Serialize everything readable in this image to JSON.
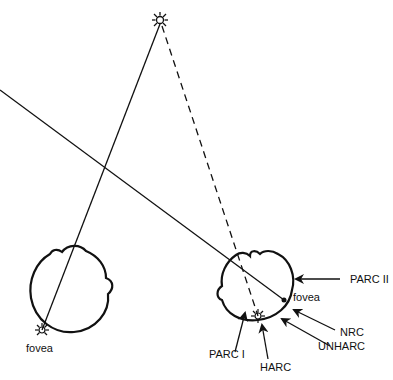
{
  "diagram": {
    "type": "binocular-fixation-schematic",
    "colors": {
      "ink": "#111111",
      "background": "#ffffff"
    },
    "target": {
      "icon": "sun-star-icon",
      "x": 160,
      "y": 20
    },
    "left_eye": {
      "center": [
        70,
        290
      ],
      "radius": 40,
      "fovea_label": "fovea",
      "fovea_point": [
        42,
        330
      ]
    },
    "right_eye": {
      "center": [
        256,
        290
      ],
      "radius": 38,
      "fovea_label": "fovea",
      "fovea_point": [
        284,
        300
      ],
      "harc_point": [
        258,
        316
      ]
    },
    "lines": {
      "left_visual_axis": {
        "style": "solid",
        "from": [
          160,
          20
        ],
        "to": [
          42,
          330
        ]
      },
      "right_target_line": {
        "style": "dashed",
        "from": [
          160,
          20
        ],
        "to": [
          258,
          316
        ]
      },
      "right_visual_axis": {
        "style": "solid",
        "from": [
          0,
          90
        ],
        "to": [
          284,
          300
        ]
      }
    },
    "labels": {
      "parc_ii": "PARC II",
      "nrc": "NRC",
      "unharc": "UNHARC",
      "harc": "HARC",
      "parc_i": "PARC I",
      "fovea_left": "fovea",
      "fovea_right": "fovea"
    }
  }
}
